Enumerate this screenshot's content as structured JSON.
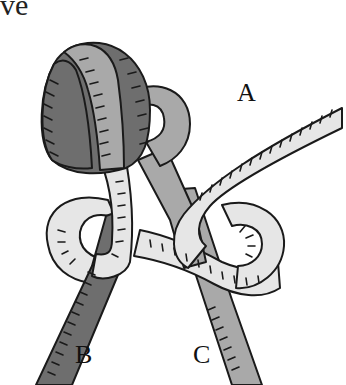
{
  "caption": {
    "text": "ve"
  },
  "diagram": {
    "type": "knot-illustration",
    "labels": {
      "a": "A",
      "b": "B",
      "c": "C"
    },
    "colors": {
      "dark_rope": "#6e6e6e",
      "medium_rope": "#a9a9a9",
      "light_rope": "#e6e6e6",
      "outline": "#1a1a1a"
    }
  }
}
